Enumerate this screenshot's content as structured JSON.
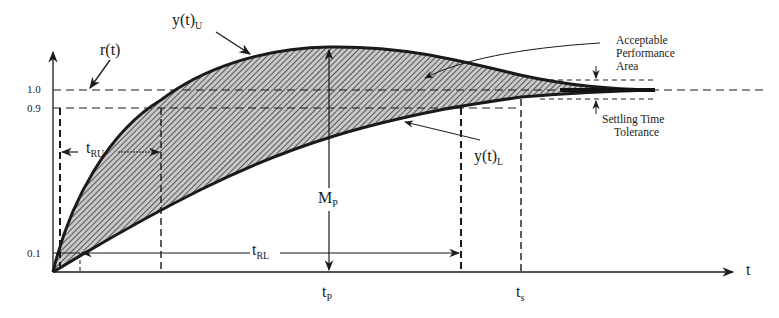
{
  "diagram": {
    "type": "step-response-performance-envelope",
    "colors": {
      "ink": "#1a1a1a",
      "hatch": "#3a3a3a",
      "background": "#ffffff"
    },
    "axes": {
      "x_label": "t",
      "y_ticks": [
        {
          "label": "1.0",
          "value": 1.0
        },
        {
          "label": "0.9",
          "value": 0.9
        },
        {
          "label": "0.1",
          "value": 0.1
        }
      ]
    },
    "labels": {
      "reference": "r(t)",
      "upper_bound": {
        "base": "y(t)",
        "sub": "U"
      },
      "lower_bound": {
        "base": "y(t)",
        "sub": "L"
      },
      "rise_time_upper": {
        "base": "t",
        "sub": "RU"
      },
      "rise_time_lower": {
        "base": "t",
        "sub": "RL"
      },
      "peak_overshoot": {
        "base": "M",
        "sub": "P"
      },
      "peak_time": {
        "base": "t",
        "sub": "P"
      },
      "settling_time": {
        "base": "t",
        "sub": "s"
      },
      "acceptable_area": [
        "Acceptable",
        "Performance",
        "Area"
      ],
      "settling_tolerance": [
        "Settling Time",
        "Tolerance"
      ]
    }
  }
}
